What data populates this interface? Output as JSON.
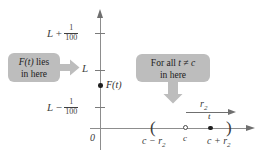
{
  "figure": {
    "type": "number-line-limit-diagram",
    "colors": {
      "callout_fill": "#bdbdbd",
      "axis": "#8d8d8d",
      "point": "#1f1f1f",
      "text": "#3a3a3a"
    }
  },
  "y_axis": {
    "arrow_direction": "up",
    "origin_label": "0",
    "ticks": [
      {
        "name": "upper-bound",
        "lead": "L",
        "operator": "+",
        "fraction_numerator": "1",
        "fraction_denominator": "100"
      },
      {
        "name": "limit",
        "lead": "L",
        "operator": "",
        "fraction_numerator": "",
        "fraction_denominator": ""
      },
      {
        "name": "lower-bound",
        "lead": "L",
        "operator": "−",
        "fraction_numerator": "1",
        "fraction_denominator": "100"
      }
    ],
    "plotted_point": {
      "label": "F(t)",
      "between": "L − 1/100 and L"
    }
  },
  "x_axis": {
    "arrow_direction": "right",
    "interval_open_paren": "(",
    "interval_close_paren": ")",
    "labels": {
      "left_endpoint": "c − r",
      "left_endpoint_sub": "2",
      "center": "c",
      "right_endpoint": "c + r",
      "right_endpoint_sub": "2",
      "point": "t"
    },
    "radius_arrow": {
      "label": "r",
      "label_sub": "2",
      "from": "c",
      "to": "c + r2"
    }
  },
  "callouts": [
    {
      "name": "f-of-t-lies-in-here",
      "line1_math": "F(t)",
      "line1_text": " lies",
      "line2_text": "in here",
      "arrow_direction": "right"
    },
    {
      "name": "for-all-t-not-equal-c",
      "line1_prefix": "For all ",
      "line1_math": "t ≠ c",
      "line2_text": "in here",
      "arrow_direction": "down"
    }
  ]
}
